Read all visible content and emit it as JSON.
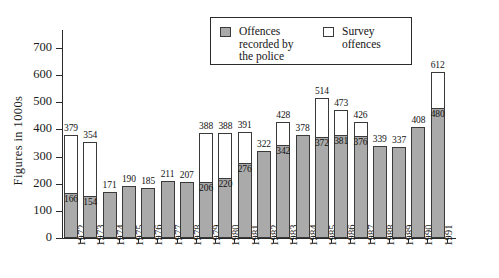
{
  "chart_data": {
    "type": "bar",
    "title": "",
    "xlabel": "",
    "ylabel": "Figures in 1000s",
    "ylim": [
      0,
      700
    ],
    "ytick_step": 100,
    "yticks": [
      "0",
      "100",
      "200",
      "300",
      "400",
      "500",
      "600",
      "700"
    ],
    "grid": false,
    "stacked": true,
    "legend_position": "top-right",
    "categories": [
      "1972",
      "1973",
      "1974",
      "1975",
      "1976",
      "1977",
      "1978",
      "1979",
      "1980",
      "1981",
      "1982",
      "1983",
      "1984",
      "1985",
      "1986",
      "1987",
      "1988",
      "1989",
      "1990",
      "1991"
    ],
    "series": [
      {
        "name": "Offences recorded by the police",
        "color": "#aaaaaa",
        "values": [
          166,
          154,
          171,
          190,
          185,
          211,
          207,
          206,
          220,
          276,
          322,
          342,
          378,
          372,
          381,
          376,
          339,
          337,
          408,
          480
        ]
      },
      {
        "name": "Survey offences",
        "color": "#ffffff",
        "values": [
          213,
          200,
          0,
          0,
          0,
          0,
          0,
          182,
          168,
          115,
          0,
          86,
          0,
          142,
          92,
          50,
          0,
          0,
          0,
          132
        ]
      }
    ],
    "totals": [
      379,
      354,
      171,
      190,
      185,
      211,
      207,
      388,
      388,
      391,
      322,
      428,
      378,
      514,
      473,
      426,
      339,
      337,
      408,
      612
    ],
    "bars": [
      {
        "year": "1972",
        "total_label": "379",
        "police_label": "166",
        "total": 379,
        "police": 166,
        "has_survey": true
      },
      {
        "year": "1973",
        "total_label": "354",
        "police_label": "154",
        "total": 354,
        "police": 154,
        "has_survey": true
      },
      {
        "year": "1974",
        "total_label": "171",
        "police_label": "",
        "total": 171,
        "police": 171,
        "has_survey": false
      },
      {
        "year": "1975",
        "total_label": "190",
        "police_label": "",
        "total": 190,
        "police": 190,
        "has_survey": false
      },
      {
        "year": "1976",
        "total_label": "185",
        "police_label": "",
        "total": 185,
        "police": 185,
        "has_survey": false
      },
      {
        "year": "1977",
        "total_label": "211",
        "police_label": "",
        "total": 211,
        "police": 211,
        "has_survey": false
      },
      {
        "year": "1978",
        "total_label": "207",
        "police_label": "",
        "total": 207,
        "police": 207,
        "has_survey": false
      },
      {
        "year": "1979",
        "total_label": "388",
        "police_label": "206",
        "total": 388,
        "police": 206,
        "has_survey": true
      },
      {
        "year": "1980",
        "total_label": "388",
        "police_label": "220",
        "total": 388,
        "police": 220,
        "has_survey": true
      },
      {
        "year": "1981",
        "total_label": "391",
        "police_label": "276",
        "total": 391,
        "police": 276,
        "has_survey": true
      },
      {
        "year": "1982",
        "total_label": "322",
        "police_label": "",
        "total": 322,
        "police": 322,
        "has_survey": false
      },
      {
        "year": "1983",
        "total_label": "428",
        "police_label": "342",
        "total": 428,
        "police": 342,
        "has_survey": true
      },
      {
        "year": "1984",
        "total_label": "378",
        "police_label": "",
        "total": 378,
        "police": 378,
        "has_survey": false
      },
      {
        "year": "1985",
        "total_label": "514",
        "police_label": "372",
        "total": 514,
        "police": 372,
        "has_survey": true
      },
      {
        "year": "1986",
        "total_label": "473",
        "police_label": "381",
        "total": 473,
        "police": 381,
        "has_survey": true
      },
      {
        "year": "1987",
        "total_label": "426",
        "police_label": "376",
        "total": 426,
        "police": 376,
        "has_survey": true
      },
      {
        "year": "1988",
        "total_label": "339",
        "police_label": "",
        "total": 339,
        "police": 339,
        "has_survey": false
      },
      {
        "year": "1989",
        "total_label": "337",
        "police_label": "",
        "total": 337,
        "police": 337,
        "has_survey": false
      },
      {
        "year": "1990",
        "total_label": "408",
        "police_label": "",
        "total": 408,
        "police": 408,
        "has_survey": false
      },
      {
        "year": "1991",
        "total_label": "612",
        "police_label": "480",
        "total": 612,
        "police": 480,
        "has_survey": true
      }
    ]
  },
  "legend": {
    "police_label": "Offences\nrecorded by\nthe  police",
    "survey_label": "Survey\noffences"
  },
  "axis": {
    "ylabel": "Figures in 1000s"
  }
}
